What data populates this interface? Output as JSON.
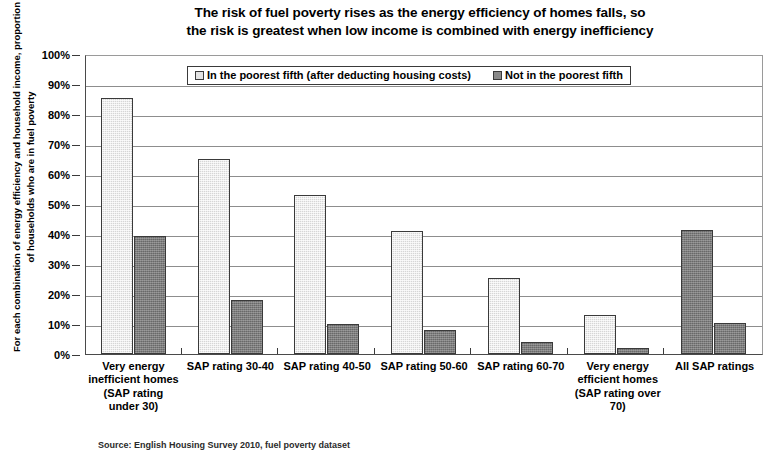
{
  "chart_data": {
    "type": "bar",
    "title": "The risk of fuel poverty rises as the energy efficiency of homes falls, so the risk is greatest when low income is combined with energy inefficiency",
    "title_line1": "The risk of fuel poverty rises as the energy efficiency of homes falls, so",
    "title_line2": "the risk is greatest when low income is combined with energy inefficiency",
    "xlabel": "",
    "ylabel": "For each combination of energy efficiency and household income, proportion of households who are in fuel poverty",
    "ylim": [
      0,
      100
    ],
    "ytick_labels": [
      "100%",
      "90%",
      "80%",
      "70%",
      "60%",
      "50%",
      "40%",
      "30%",
      "20%",
      "10%",
      "0%"
    ],
    "ytick_values": [
      100,
      90,
      80,
      70,
      60,
      50,
      40,
      30,
      20,
      10,
      0
    ],
    "grid": true,
    "legend_position": "top-center",
    "categories": [
      "Very energy inefficient homes (SAP rating under 30)",
      "SAP rating 30-40",
      "SAP rating 40-50",
      "SAP rating 50-60",
      "SAP rating 60-70",
      "Very energy efficient homes (SAP rating over 70)",
      "All SAP ratings"
    ],
    "series": [
      {
        "name": "In the poorest fifth (after deducting housing costs)",
        "color": "#d6d6d6",
        "values": [
          85.5,
          65.0,
          53.0,
          41.0,
          25.5,
          13.0,
          41.5
        ]
      },
      {
        "name": "Not in the poorest fifth",
        "color": "#7d7d7d",
        "values": [
          39.5,
          18.0,
          10.0,
          8.0,
          4.0,
          2.0,
          10.5
        ]
      }
    ]
  },
  "footer": {
    "text": "Source: English Housing Survey 2010, fuel poverty dataset"
  }
}
